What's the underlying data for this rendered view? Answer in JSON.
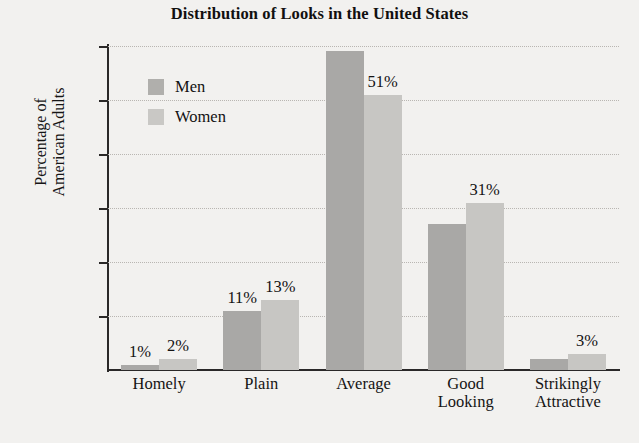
{
  "chart_data": {
    "type": "bar",
    "title": "Distribution of Looks in the United States",
    "xlabel": "",
    "ylabel": "Percentage of American Adults",
    "ylabel_lines": [
      "Percentage of",
      "American Adults"
    ],
    "ylim": [
      0,
      60
    ],
    "ytick_labels": [
      "60%",
      "50%",
      "40%",
      "30%",
      "20%",
      "10%"
    ],
    "ytick_values": [
      60,
      50,
      40,
      30,
      20,
      10
    ],
    "grid": true,
    "legend_position": "upper-left-inside",
    "categories": [
      "Homely",
      "Plain",
      "Average",
      "Good Looking",
      "Strikingly Attractive"
    ],
    "category_lines": [
      [
        "Homely"
      ],
      [
        "Plain"
      ],
      [
        "Average"
      ],
      [
        "Good",
        "Looking"
      ],
      [
        "Strikingly",
        "Attractive"
      ]
    ],
    "series": [
      {
        "name": "Men",
        "color": "#a9a8a6",
        "values": [
          1,
          11,
          59,
          27,
          2
        ],
        "labels": [
          "1%",
          "11%",
          "",
          "",
          ""
        ]
      },
      {
        "name": "Women",
        "color": "#c7c6c3",
        "values": [
          2,
          13,
          51,
          31,
          3
        ],
        "labels": [
          "2%",
          "13%",
          "51%",
          "31%",
          "3%"
        ]
      }
    ]
  },
  "legend": {
    "items": [
      {
        "label": "Men",
        "color": "#a9a8a6"
      },
      {
        "label": "Women",
        "color": "#c7c6c3"
      }
    ]
  }
}
